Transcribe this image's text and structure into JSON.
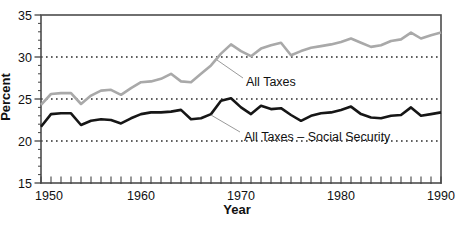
{
  "figure": {
    "background": "#ffffff",
    "frame_color": "#4d4d4d",
    "gridline_color": "#2b2b2b",
    "tick_color": "#444444",
    "text_color": "#111111"
  },
  "chart_data": {
    "type": "line",
    "title": "",
    "xlabel": "Year",
    "ylabel": "Percent",
    "xlim": [
      1950,
      1990
    ],
    "ylim": [
      15,
      35
    ],
    "xticks": [
      1950,
      1960,
      1970,
      1980,
      1990
    ],
    "yticks": [
      15,
      20,
      25,
      30,
      35
    ],
    "dotted_gridlines": [
      20,
      25,
      30
    ],
    "grid": "horizontal-dotted",
    "legend_position": "inline-annotations",
    "x": [
      1950,
      1951,
      1952,
      1953,
      1954,
      1955,
      1956,
      1957,
      1958,
      1959,
      1960,
      1961,
      1962,
      1963,
      1964,
      1965,
      1966,
      1967,
      1968,
      1969,
      1970,
      1971,
      1972,
      1973,
      1974,
      1975,
      1976,
      1977,
      1978,
      1979,
      1980,
      1981,
      1982,
      1983,
      1984,
      1985,
      1986,
      1987,
      1988,
      1989,
      1990
    ],
    "series": [
      {
        "name": "All Taxes",
        "color": "#a9a9a9",
        "values": [
          24.3,
          25.6,
          25.7,
          25.7,
          24.4,
          25.4,
          26.0,
          26.1,
          25.5,
          26.3,
          27.0,
          27.1,
          27.4,
          28.0,
          27.1,
          27.0,
          28.0,
          29.0,
          30.4,
          31.5,
          30.7,
          30.1,
          31.0,
          31.4,
          31.7,
          30.2,
          30.7,
          31.1,
          31.3,
          31.5,
          31.8,
          32.2,
          31.7,
          31.2,
          31.4,
          31.9,
          32.1,
          32.9,
          32.2,
          32.6,
          32.9
        ]
      },
      {
        "name": "All Taxes – Social Security",
        "color": "#161616",
        "values": [
          21.7,
          23.2,
          23.3,
          23.3,
          21.9,
          22.4,
          22.6,
          22.5,
          22.1,
          22.7,
          23.2,
          23.4,
          23.4,
          23.5,
          23.7,
          22.6,
          22.7,
          23.2,
          24.8,
          25.1,
          24.0,
          23.2,
          24.2,
          23.8,
          23.9,
          23.1,
          22.4,
          23.0,
          23.3,
          23.4,
          23.7,
          24.1,
          23.2,
          22.8,
          22.7,
          23.0,
          23.1,
          24.0,
          23.0,
          23.2,
          23.4
        ]
      }
    ],
    "annotations": [
      {
        "text": "All Taxes"
      },
      {
        "text": "All Taxes – Social Security"
      }
    ]
  }
}
